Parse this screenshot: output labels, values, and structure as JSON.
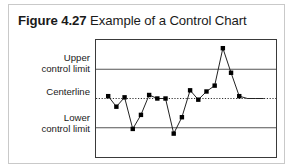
{
  "figure": {
    "number": "Figure 4.27",
    "caption": "Example of a Control Chart"
  },
  "axis_labels": {
    "upper": "Upper\ncontrol limit",
    "upper_line1": "Upper",
    "upper_line2": "control limit",
    "center": "Centerline",
    "lower_line1": "Lower",
    "lower_line2": "control limit"
  },
  "colors": {
    "frame": "#3a3a3a",
    "limit_line": "#555555",
    "centerline": "#333333",
    "series_line": "#222222",
    "marker": "#000000",
    "outer_border": "#c9c9c9",
    "text": "#1a1a1a"
  },
  "chart_data": {
    "type": "line",
    "title": "Example of a Control Chart",
    "xlabel": "",
    "ylabel": "",
    "grid": false,
    "legend": "none",
    "ylim": [
      0,
      100
    ],
    "xlim": [
      0,
      21
    ],
    "reference_lines": [
      {
        "name": "Upper control limit",
        "value": 75,
        "style": "solid"
      },
      {
        "name": "Centerline",
        "value": 50,
        "style": "dotted"
      },
      {
        "name": "Lower control limit",
        "value": 25,
        "style": "solid"
      }
    ],
    "x": [
      1,
      2,
      3,
      4,
      5,
      6,
      7,
      8,
      9,
      10,
      11,
      12,
      13,
      14,
      15,
      16,
      17,
      18,
      19,
      20
    ],
    "values": [
      52,
      43,
      51,
      24,
      36,
      53,
      50,
      50,
      20,
      34,
      57,
      49,
      56,
      61,
      93,
      72,
      52,
      50,
      50,
      50
    ],
    "series": [
      {
        "name": "Measurement",
        "marker": "square",
        "values": [
          52,
          43,
          51,
          24,
          36,
          53,
          50,
          50,
          20,
          34,
          57,
          49,
          56,
          61,
          93,
          72,
          52,
          50,
          50,
          50
        ]
      }
    ],
    "points_visible": 17,
    "out_of_control_points": [
      {
        "x": 15,
        "value": 93,
        "note": "above upper control limit"
      }
    ]
  }
}
